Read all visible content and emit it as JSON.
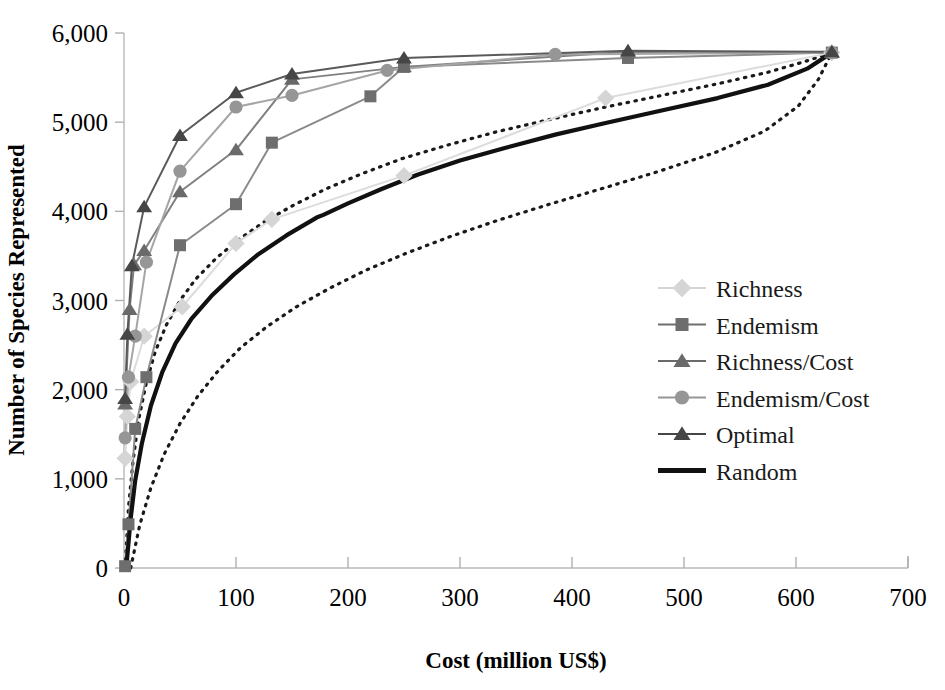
{
  "chart_data": {
    "type": "line",
    "title": "",
    "xlabel": "Cost (million US$)",
    "ylabel": "Number of Species Represented",
    "xlim": [
      0,
      700
    ],
    "ylim": [
      0,
      6000
    ],
    "xticks": [
      "0",
      "100",
      "200",
      "300",
      "400",
      "500",
      "600",
      "700"
    ],
    "xtick_values": [
      0,
      100,
      200,
      300,
      400,
      500,
      600,
      700
    ],
    "yticks": [
      "0",
      "1,000",
      "2,000",
      "3,000",
      "4,000",
      "5,000",
      "6,000"
    ],
    "ytick_values": [
      0,
      1000,
      2000,
      3000,
      4000,
      5000,
      6000
    ],
    "grid": false,
    "legend_position": "center-right",
    "series": [
      {
        "name": "Richness",
        "marker": "diamond",
        "color": "#d5d5d5",
        "line_color": "#dcdcdc",
        "line_width": 2.0,
        "dash": "none",
        "points": [
          [
            1,
            1230
          ],
          [
            3,
            1700
          ],
          [
            6,
            2090
          ],
          [
            18,
            2600
          ],
          [
            52,
            2930
          ],
          [
            100,
            3640
          ],
          [
            132,
            3910
          ],
          [
            250,
            4400
          ],
          [
            430,
            5270
          ],
          [
            632,
            5780
          ]
        ]
      },
      {
        "name": "Endemism",
        "marker": "square",
        "color": "#6e6e6e",
        "line_color": "#8a8a8a",
        "line_width": 2.0,
        "dash": "none",
        "points": [
          [
            1,
            20
          ],
          [
            4,
            490
          ],
          [
            10,
            1560
          ],
          [
            20,
            2140
          ],
          [
            50,
            3620
          ],
          [
            100,
            4080
          ],
          [
            132,
            4770
          ],
          [
            220,
            5290
          ],
          [
            250,
            5620
          ],
          [
            450,
            5720
          ],
          [
            632,
            5780
          ]
        ]
      },
      {
        "name": "Richness/Cost",
        "marker": "triangle",
        "color": "#6a6a6a",
        "line_color": "#808080",
        "line_width": 2.0,
        "dash": "none",
        "points": [
          [
            1,
            1840
          ],
          [
            5,
            2900
          ],
          [
            9,
            3400
          ],
          [
            18,
            3560
          ],
          [
            50,
            4220
          ],
          [
            100,
            4690
          ],
          [
            150,
            5480
          ],
          [
            250,
            5620
          ],
          [
            450,
            5790
          ],
          [
            632,
            5780
          ]
        ]
      },
      {
        "name": "Endemism/Cost",
        "marker": "circle",
        "color": "#969696",
        "line_color": "#a5a5a5",
        "line_width": 2.0,
        "dash": "none",
        "points": [
          [
            1,
            1460
          ],
          [
            4,
            2140
          ],
          [
            10,
            2600
          ],
          [
            20,
            3430
          ],
          [
            50,
            4450
          ],
          [
            100,
            5170
          ],
          [
            150,
            5300
          ],
          [
            235,
            5580
          ],
          [
            385,
            5760
          ],
          [
            632,
            5780
          ]
        ]
      },
      {
        "name": "Optimal",
        "marker": "triangle",
        "color": "#464646",
        "line_color": "#5a5a5a",
        "line_width": 2.0,
        "dash": "none",
        "points": [
          [
            1,
            1900
          ],
          [
            3,
            2620
          ],
          [
            7,
            3390
          ],
          [
            18,
            4050
          ],
          [
            50,
            4850
          ],
          [
            100,
            5330
          ],
          [
            150,
            5540
          ],
          [
            250,
            5720
          ],
          [
            450,
            5800
          ],
          [
            632,
            5790
          ]
        ]
      },
      {
        "name": "Random",
        "marker": "none",
        "color": "#111111",
        "line_color": "#111111",
        "line_width": 4.2,
        "dash": "none",
        "points": [
          [
            2,
            0
          ],
          [
            6,
            560
          ],
          [
            10,
            980
          ],
          [
            16,
            1400
          ],
          [
            24,
            1820
          ],
          [
            34,
            2190
          ],
          [
            46,
            2520
          ],
          [
            60,
            2790
          ],
          [
            78,
            3050
          ],
          [
            98,
            3290
          ],
          [
            120,
            3520
          ],
          [
            145,
            3730
          ],
          [
            172,
            3930
          ],
          [
            178,
            3960
          ],
          [
            200,
            4090
          ],
          [
            230,
            4250
          ],
          [
            262,
            4410
          ],
          [
            300,
            4570
          ],
          [
            340,
            4710
          ],
          [
            385,
            4860
          ],
          [
            430,
            4990
          ],
          [
            480,
            5130
          ],
          [
            530,
            5270
          ],
          [
            575,
            5420
          ],
          [
            610,
            5600
          ],
          [
            632,
            5780
          ]
        ]
      }
    ],
    "confidence_bands": [
      {
        "name": "random-upper-ci",
        "color": "#1a1a1a",
        "dash": "dotted",
        "line_width": 3.2,
        "points": [
          [
            1,
            0
          ],
          [
            4,
            680
          ],
          [
            8,
            1190
          ],
          [
            13,
            1660
          ],
          [
            20,
            2080
          ],
          [
            28,
            2430
          ],
          [
            38,
            2730
          ],
          [
            50,
            3000
          ],
          [
            64,
            3240
          ],
          [
            82,
            3470
          ],
          [
            102,
            3680
          ],
          [
            125,
            3880
          ],
          [
            150,
            4060
          ],
          [
            180,
            4250
          ],
          [
            212,
            4420
          ],
          [
            248,
            4590
          ],
          [
            288,
            4740
          ],
          [
            332,
            4890
          ],
          [
            380,
            5030
          ],
          [
            430,
            5170
          ],
          [
            480,
            5300
          ],
          [
            530,
            5430
          ],
          [
            575,
            5560
          ],
          [
            608,
            5680
          ],
          [
            632,
            5780
          ]
        ]
      },
      {
        "name": "random-lower-ci",
        "color": "#1a1a1a",
        "dash": "dotted",
        "line_width": 3.2,
        "points": [
          [
            6,
            0
          ],
          [
            14,
            480
          ],
          [
            24,
            900
          ],
          [
            36,
            1280
          ],
          [
            50,
            1620
          ],
          [
            66,
            1930
          ],
          [
            84,
            2210
          ],
          [
            104,
            2470
          ],
          [
            128,
            2710
          ],
          [
            154,
            2930
          ],
          [
            184,
            3140
          ],
          [
            216,
            3340
          ],
          [
            252,
            3530
          ],
          [
            292,
            3720
          ],
          [
            334,
            3900
          ],
          [
            380,
            4080
          ],
          [
            428,
            4260
          ],
          [
            478,
            4450
          ],
          [
            528,
            4660
          ],
          [
            572,
            4900
          ],
          [
            602,
            5180
          ],
          [
            620,
            5480
          ],
          [
            632,
            5780
          ]
        ]
      }
    ]
  },
  "legend": {
    "items": [
      {
        "label": "Richness",
        "marker": "diamond-icon",
        "color": "#d5d5d5"
      },
      {
        "label": "Endemism",
        "marker": "square-icon",
        "color": "#6e6e6e"
      },
      {
        "label": "Richness/Cost",
        "marker": "triangle-icon",
        "color": "#6a6a6a"
      },
      {
        "label": "Endemism/Cost",
        "marker": "circle-icon",
        "color": "#969696"
      },
      {
        "label": "Optimal",
        "marker": "triangle-icon",
        "color": "#464646"
      },
      {
        "label": "Random",
        "marker": "line-icon",
        "color": "#111111"
      }
    ]
  }
}
